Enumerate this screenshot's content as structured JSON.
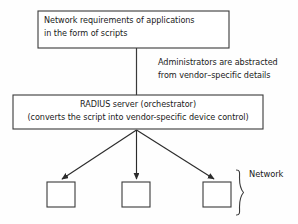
{
  "diagram": {
    "type": "block-flow-diagram",
    "background_color": "#fefefe",
    "stroke_color": "#333333",
    "text_color": "#1a1a1a",
    "nodes": {
      "requirements_box": {
        "name": "network-requirements-box",
        "line1": "Network requirements of applications",
        "line2": "in the form of scripts",
        "x": 38,
        "y": 11,
        "width": 191,
        "height": 37
      },
      "radius_box": {
        "name": "radius-server-box",
        "line1": "RADIUS server (orchestrator)",
        "line2": "(converts the script into vendor-specific device control)",
        "x": 13,
        "y": 95,
        "width": 250,
        "height": 34
      },
      "device_boxes": [
        {
          "name": "network-device-1",
          "x": 47,
          "y": 182,
          "width": 28,
          "height": 25
        },
        {
          "name": "network-device-2",
          "x": 122,
          "y": 182,
          "width": 28,
          "height": 25
        },
        {
          "name": "network-device-3",
          "x": 203,
          "y": 182,
          "width": 28,
          "height": 25
        }
      ]
    },
    "annotations": {
      "abstraction_note": {
        "name": "abstraction-note",
        "line1": "Administrators are abstracted",
        "line2": "from vendor–specific details"
      },
      "network_group_label": "Network"
    },
    "connectors": {
      "vertical_link": {
        "from": "requirements_box",
        "to": "radius_box",
        "x": 136,
        "y1": 48,
        "y2": 95
      },
      "fanout_origin": {
        "x": 136,
        "y": 130
      },
      "arrows": [
        {
          "name": "arrow-to-device-1",
          "x1": 136,
          "y1": 130,
          "x2": 62,
          "y2": 180
        },
        {
          "name": "arrow-to-device-2",
          "x1": 136,
          "y1": 130,
          "x2": 136,
          "y2": 180
        },
        {
          "name": "arrow-to-device-3",
          "x1": 136,
          "y1": 130,
          "x2": 214,
          "y2": 180
        }
      ],
      "brace": {
        "name": "network-group-brace",
        "x": 234,
        "y_top": 170,
        "y_bottom": 216
      }
    }
  }
}
